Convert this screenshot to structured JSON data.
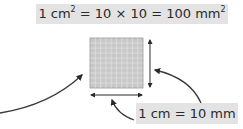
{
  "diagram": {
    "title_label": {
      "prefix": "1 cm",
      "sup1": "2",
      "middle": " = 10 × 10 = 100 mm",
      "sup2": "2"
    },
    "side_label": "1 cm = 10 mm",
    "grid": {
      "rows": 10,
      "cols": 10,
      "fill": "#c8c8c8",
      "line": "#a8a8a8"
    },
    "colors": {
      "arrow": "#2a2a2a",
      "label_bg": "#e3e3e3",
      "text": "#2a2a2a"
    }
  }
}
